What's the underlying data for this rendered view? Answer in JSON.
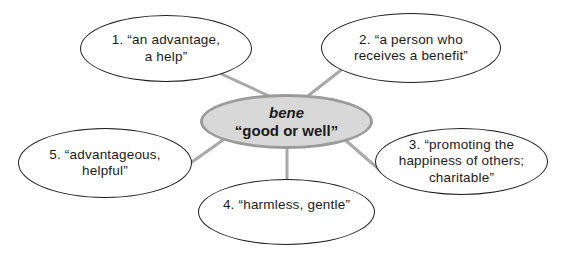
{
  "diagram": {
    "root": {
      "term": "bene",
      "meaning": "“good or well”"
    },
    "definitions": [
      {
        "id": "1",
        "lines": [
          "1. “an advantage,",
          "a help”"
        ]
      },
      {
        "id": "2",
        "lines": [
          "2. “a person who",
          "receives a benefit”"
        ]
      },
      {
        "id": "3",
        "lines": [
          "3. “promoting the",
          "happiness of others;",
          "charitable”"
        ]
      },
      {
        "id": "4",
        "lines": [
          "4. “harmless, gentle”"
        ]
      },
      {
        "id": "5",
        "lines": [
          "5. “advantageous,",
          "helpful”"
        ]
      }
    ],
    "colors": {
      "background": "#ffffff",
      "outer_fill": "#ffffff",
      "outer_stroke": "#1c1c1c",
      "center_fill": "#d8d8d8",
      "center_stroke": "#9b9b9b",
      "connector": "#a9a9a9",
      "text": "#1a1a1a"
    }
  }
}
